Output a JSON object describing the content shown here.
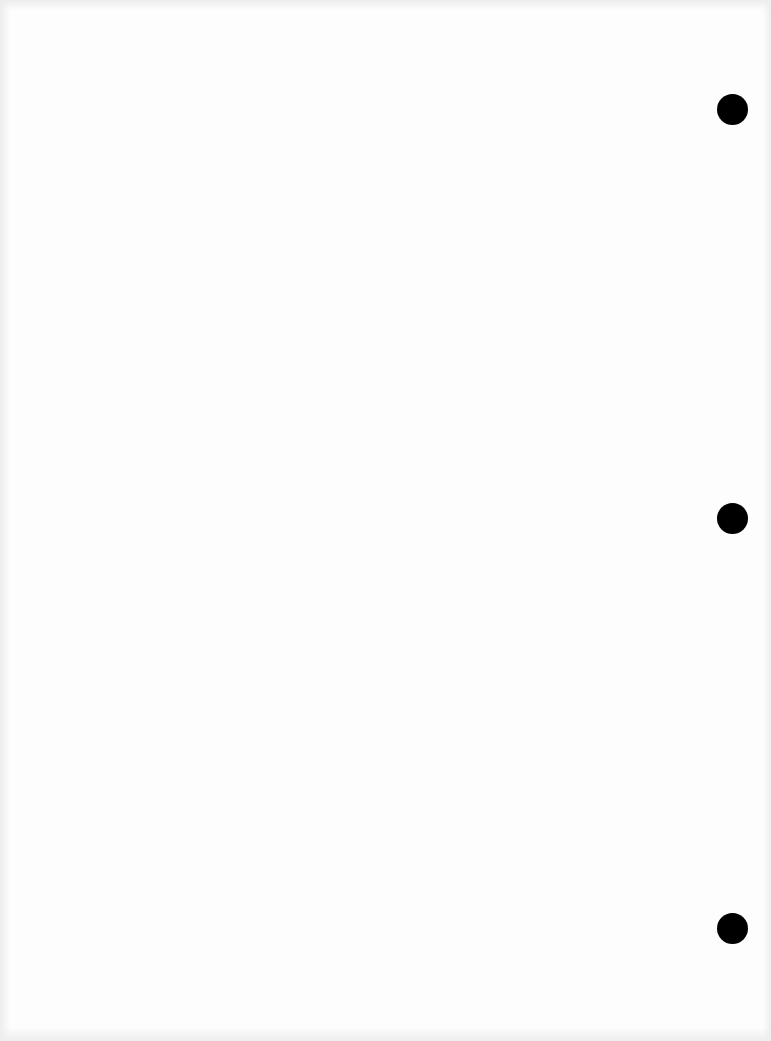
{
  "document": {
    "type": "blank scanned page",
    "background_color": "#fdfdfd",
    "hole_color": "#000000",
    "punch_holes": [
      {
        "x": 717,
        "y": 94
      },
      {
        "x": 717,
        "y": 503
      },
      {
        "x": 717,
        "y": 913
      }
    ]
  }
}
